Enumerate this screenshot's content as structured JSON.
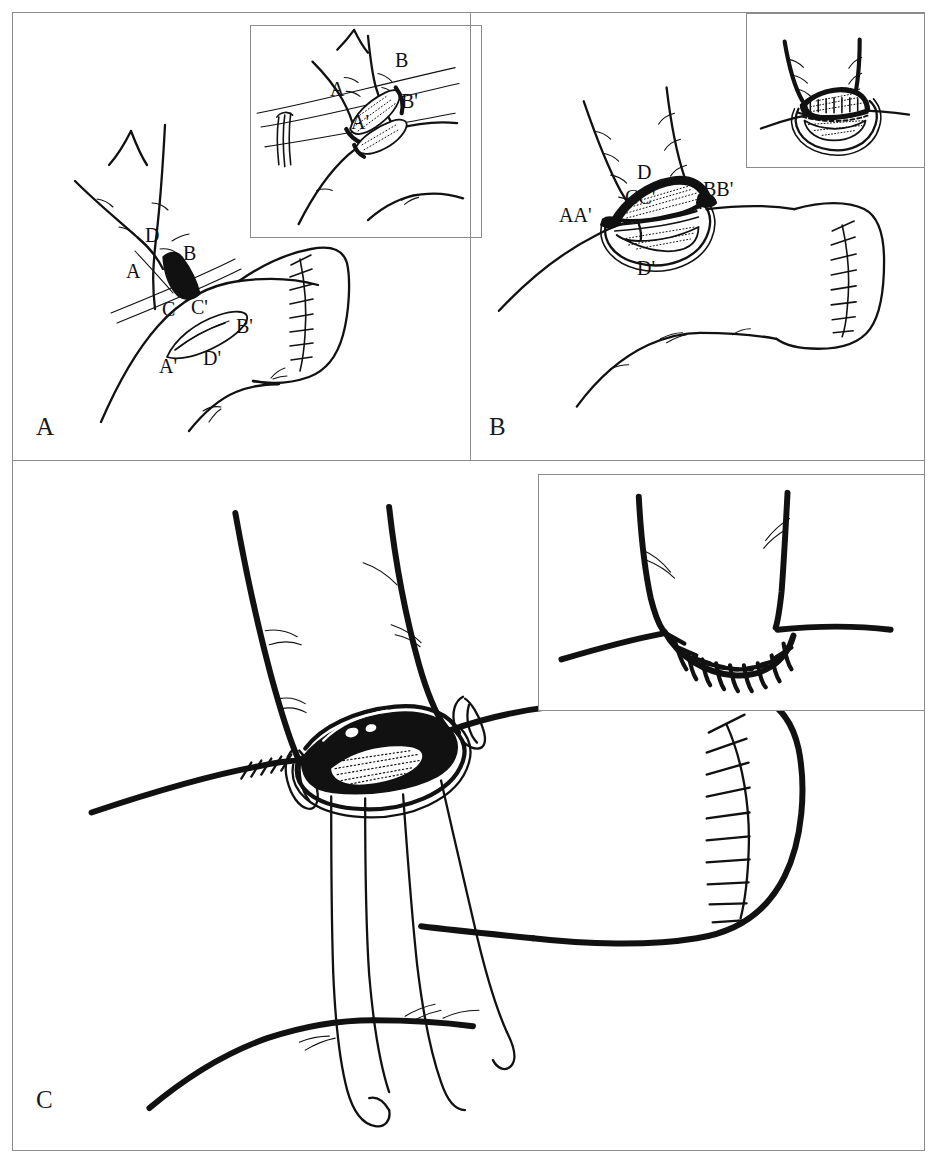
{
  "figure": {
    "type": "surgical-technique-illustration",
    "background_color": "#ffffff",
    "ink_color": "#111111",
    "frame_color": "#8c8c8c"
  },
  "panels": [
    {
      "id": "panel-a",
      "letter": "A",
      "caption": "",
      "labels": [
        {
          "id": "a-D",
          "text": "D",
          "x": 138,
          "y": 224
        },
        {
          "id": "a-B",
          "text": "B",
          "x": 176,
          "y": 240
        },
        {
          "id": "a-A",
          "text": "A",
          "x": 119,
          "y": 258
        },
        {
          "id": "a-C",
          "text": "C",
          "x": 155,
          "y": 296
        },
        {
          "id": "a-Cp",
          "text": "C'",
          "x": 184,
          "y": 294
        },
        {
          "id": "a-Bp",
          "text": "B'",
          "x": 229,
          "y": 313
        },
        {
          "id": "a-Dp",
          "text": "D'",
          "x": 196,
          "y": 345
        },
        {
          "id": "a-Ap",
          "text": "A'",
          "x": 152,
          "y": 353
        }
      ],
      "inset": {
        "id": "inset-a",
        "labels": [
          {
            "id": "ai-B",
            "text": "B",
            "x": 150,
            "y": 35
          },
          {
            "id": "ai-A",
            "text": "A",
            "x": 85,
            "y": 64
          },
          {
            "id": "ai-Bp",
            "text": "B'",
            "x": 156,
            "y": 76
          },
          {
            "id": "ai-Ap",
            "text": "A'",
            "x": 106,
            "y": 97
          }
        ]
      }
    },
    {
      "id": "panel-b",
      "letter": "B",
      "caption": "",
      "labels": [
        {
          "id": "b-D",
          "text": "D",
          "x": 172,
          "y": 160
        },
        {
          "id": "b-CCp",
          "text": "CC'",
          "x": 163,
          "y": 185
        },
        {
          "id": "b-BBp",
          "text": "BB'",
          "x": 238,
          "y": 178
        },
        {
          "id": "b-AAp",
          "text": "AA'",
          "x": 98,
          "y": 203
        },
        {
          "id": "b-Dp",
          "text": "D'",
          "x": 172,
          "y": 255
        }
      ],
      "inset": {
        "id": "inset-b",
        "labels": []
      }
    },
    {
      "id": "panel-c",
      "letter": "C",
      "caption": "",
      "labels": [],
      "inset": {
        "id": "inset-c",
        "labels": []
      }
    }
  ],
  "panel_letters": {
    "a": {
      "text": "A",
      "x": 23,
      "y": 404
    },
    "b": {
      "text": "B",
      "x": 18,
      "y": 404
    },
    "c": {
      "text": "C",
      "x": 23,
      "y": 630
    }
  },
  "legend_notes": {
    "stipple_fill": "halftone-dot luminal surface",
    "solid_fill": "open lumen / cut edge",
    "sutures": "interrupted stitch marks along anastomotic line"
  }
}
